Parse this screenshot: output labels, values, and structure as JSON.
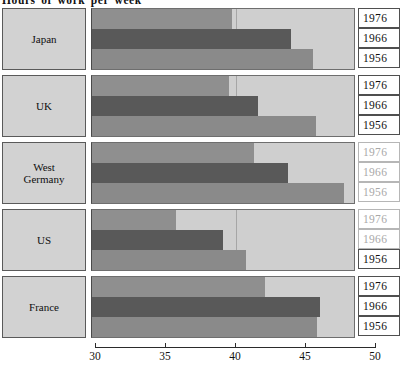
{
  "chart_data": {
    "type": "bar",
    "orientation": "horizontal",
    "title": "Hours of work per week",
    "xlabel": "",
    "ylabel": "",
    "xlim": [
      30,
      50
    ],
    "xticks": [
      30,
      35,
      40,
      45,
      50
    ],
    "xtick_labels": [
      "30",
      "35",
      "40",
      "45",
      "50"
    ],
    "grid": false,
    "legend": "inline-year-boxes-right",
    "categories": [
      "Japan",
      "UK",
      "West Germany",
      "US",
      "France"
    ],
    "series": [
      {
        "name": "1976",
        "values": [
          39.7,
          39.5,
          41.3,
          35.7,
          42.1
        ]
      },
      {
        "name": "1966",
        "values": [
          43.9,
          41.6,
          43.7,
          39.1,
          46.0
        ]
      },
      {
        "name": "1956",
        "values": [
          45.5,
          45.7,
          47.7,
          40.7,
          45.8
        ]
      }
    ],
    "groups": [
      {
        "country": "Japan",
        "country_lines": [
          "Japan"
        ],
        "bars": [
          {
            "year": "1976",
            "value": 39.7,
            "faded_year_label": false
          },
          {
            "year": "1966",
            "value": 43.9,
            "faded_year_label": false
          },
          {
            "year": "1956",
            "value": 45.5,
            "faded_year_label": false
          }
        ]
      },
      {
        "country": "UK",
        "country_lines": [
          "UK"
        ],
        "bars": [
          {
            "year": "1976",
            "value": 39.5,
            "faded_year_label": false
          },
          {
            "year": "1966",
            "value": 41.6,
            "faded_year_label": false
          },
          {
            "year": "1956",
            "value": 45.7,
            "faded_year_label": false
          }
        ]
      },
      {
        "country": "West Germany",
        "country_lines": [
          "West",
          "Germany"
        ],
        "bars": [
          {
            "year": "1976",
            "value": 41.3,
            "faded_year_label": true
          },
          {
            "year": "1966",
            "value": 43.7,
            "faded_year_label": true
          },
          {
            "year": "1956",
            "value": 47.7,
            "faded_year_label": true
          }
        ]
      },
      {
        "country": "US",
        "country_lines": [
          "US"
        ],
        "bars": [
          {
            "year": "1976",
            "value": 35.7,
            "faded_year_label": true
          },
          {
            "year": "1966",
            "value": 39.1,
            "faded_year_label": true
          },
          {
            "year": "1956",
            "value": 40.7,
            "faded_year_label": false
          }
        ]
      },
      {
        "country": "France",
        "country_lines": [
          "France"
        ],
        "bars": [
          {
            "year": "1976",
            "value": 42.1,
            "faded_year_label": false
          },
          {
            "year": "1966",
            "value": 46.0,
            "faded_year_label": false
          },
          {
            "year": "1956",
            "value": 45.8,
            "faded_year_label": false
          }
        ]
      }
    ],
    "colors": {
      "bar_1976": "#8f8f8f",
      "bar_1966": "#595959",
      "bar_1956": "#8a8a8a",
      "plot_background": "#cfcfcf",
      "label_box_background": "#d2d2d2",
      "axis": "#2b2b2b",
      "page_background": "#ffffff"
    }
  }
}
